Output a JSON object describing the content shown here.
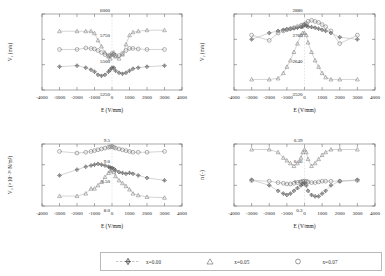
{
  "figure": {
    "series_colors": {
      "x000": "#4a4a4a",
      "x005": "#6e6e6e",
      "x007": "#8a8a8a"
    },
    "line_color": "#9a9a9a",
    "axis_color": "#555555"
  },
  "legend": {
    "items": [
      {
        "label": "x=0.00",
        "marker": "plus-diamond",
        "color": "#4a4a4a"
      },
      {
        "label": "x=0.05",
        "marker": "triangle",
        "color": "#7a7a7a"
      },
      {
        "label": "x=0.07",
        "marker": "circle",
        "color": "#6e6e6e"
      }
    ]
  },
  "chart_data": [
    {
      "type": "scatter",
      "panel": "top-left",
      "title": "",
      "xlabel": "E (V/mm)",
      "ylabel": "V₁ (m/s)",
      "xlim": [
        -4000,
        4000
      ],
      "ylim": [
        5250,
        6000
      ],
      "xticks": [
        -4000,
        -3000,
        -2000,
        -1000,
        0,
        1000,
        2000,
        3000,
        4000
      ],
      "xticklabels": [
        "-4000",
        "-3000",
        "-2000",
        "-1000",
        "0",
        "1000",
        "2000",
        "3000",
        "4000"
      ],
      "yticks": [
        5250,
        5500,
        5750,
        6000
      ],
      "yticklabels": [
        "5250",
        "5500",
        "5750",
        "6000"
      ],
      "grid": false,
      "series": [
        {
          "name": "x=0.00",
          "marker": "plus-diamond",
          "color": "#4a4a4a",
          "x": [
            -3000,
            -2000,
            -1500,
            -1200,
            -1000,
            -800,
            -600,
            -400,
            -200,
            -100,
            0,
            100,
            200,
            400,
            600,
            800,
            1000,
            1200,
            1500,
            2000,
            3000
          ],
          "y": [
            5480,
            5490,
            5470,
            5450,
            5430,
            5400,
            5390,
            5400,
            5430,
            5450,
            5470,
            5470,
            5440,
            5420,
            5410,
            5420,
            5440,
            5460,
            5470,
            5480,
            5490
          ]
        },
        {
          "name": "x=0.05",
          "marker": "triangle",
          "color": "#7a7a7a",
          "x": [
            -3000,
            -2000,
            -1500,
            -1200,
            -1000,
            -800,
            -600,
            -400,
            -200,
            -100,
            0,
            100,
            200,
            400,
            600,
            800,
            1000,
            1200,
            1500,
            2000,
            3000
          ],
          "y": [
            5830,
            5830,
            5830,
            5830,
            5810,
            5740,
            5680,
            5620,
            5580,
            5560,
            5600,
            5620,
            5580,
            5560,
            5600,
            5700,
            5790,
            5820,
            5830,
            5840,
            5840
          ]
        },
        {
          "name": "x=0.07",
          "marker": "circle",
          "color": "#6e6e6e",
          "x": [
            -3000,
            -2000,
            -1500,
            -1200,
            -1000,
            -800,
            -600,
            -400,
            -200,
            -100,
            0,
            100,
            200,
            400,
            600,
            800,
            1000,
            1200,
            1500,
            2000,
            3000
          ],
          "y": [
            5650,
            5650,
            5665,
            5660,
            5655,
            5640,
            5620,
            5600,
            5590,
            5590,
            5610,
            5600,
            5590,
            5590,
            5610,
            5640,
            5660,
            5660,
            5655,
            5650,
            5650
          ]
        }
      ]
    },
    {
      "type": "scatter",
      "panel": "top-right",
      "title": "",
      "xlabel": "E (V/mm)",
      "ylabel": "V₂ (m/s)",
      "xlim": [
        -4000,
        4000
      ],
      "ylim": [
        2520,
        2880
      ],
      "xticks": [
        -4000,
        -3000,
        -2000,
        -1000,
        0,
        1000,
        2000,
        3000,
        4000
      ],
      "xticklabels": [
        "-4000",
        "-3000",
        "-2000",
        "-1000",
        "0",
        "1000",
        "2000",
        "3000",
        "4000"
      ],
      "yticks": [
        2520,
        2640,
        2760,
        2880
      ],
      "yticklabels": [
        "2520",
        "2640",
        "2760",
        "2880"
      ],
      "grid": false,
      "series": [
        {
          "name": "x=0.00",
          "marker": "plus-diamond",
          "color": "#4a4a4a",
          "x": [
            -3000,
            -2000,
            -1500,
            -1200,
            -1000,
            -800,
            -600,
            -400,
            -200,
            -100,
            0,
            100,
            200,
            400,
            600,
            800,
            1000,
            1200,
            1500,
            2000,
            3000
          ],
          "y": [
            2760,
            2790,
            2800,
            2805,
            2808,
            2810,
            2812,
            2815,
            2818,
            2820,
            2830,
            2825,
            2820,
            2818,
            2815,
            2810,
            2805,
            2800,
            2790,
            2770,
            2760
          ]
        },
        {
          "name": "x=0.05",
          "marker": "triangle",
          "color": "#7a7a7a",
          "x": [
            -3000,
            -2000,
            -1500,
            -1200,
            -1000,
            -800,
            -600,
            -400,
            -200,
            -100,
            0,
            100,
            200,
            400,
            600,
            800,
            1000,
            1200,
            1500,
            2000,
            3000
          ],
          "y": [
            2570,
            2570,
            2575,
            2600,
            2630,
            2660,
            2700,
            2740,
            2780,
            2790,
            2790,
            2780,
            2745,
            2700,
            2660,
            2630,
            2600,
            2580,
            2570,
            2570,
            2570
          ]
        },
        {
          "name": "x=0.07",
          "marker": "circle",
          "color": "#6e6e6e",
          "x": [
            -3000,
            -2000,
            -1500,
            -1200,
            -1000,
            -800,
            -600,
            -400,
            -200,
            -100,
            0,
            100,
            200,
            400,
            600,
            800,
            1000,
            1200,
            1500,
            2000,
            3000
          ],
          "y": [
            2780,
            2755,
            2790,
            2800,
            2805,
            2810,
            2815,
            2820,
            2825,
            2828,
            2830,
            2835,
            2845,
            2850,
            2845,
            2840,
            2830,
            2820,
            2800,
            2740,
            2780
          ]
        }
      ]
    },
    {
      "type": "scatter",
      "panel": "bottom-left",
      "title": "",
      "xlabel": "E (V/mm)",
      "ylabel": "V₃ (×10⁻²⁰ N/m²)",
      "xlim": [
        -4000,
        4000
      ],
      "ylim": [
        8.0,
        9.5
      ],
      "xticks": [
        -4000,
        -3000,
        -2000,
        -1000,
        0,
        1000,
        2000,
        3000,
        4000
      ],
      "xticklabels": [
        "-4000",
        "-3000",
        "-2000",
        "-1000",
        "0",
        "1000",
        "2000",
        "3000",
        "4000"
      ],
      "yticks": [
        8.0,
        8.5,
        9.0,
        9.5
      ],
      "yticklabels": [
        "8.0",
        "8.50",
        "9.0",
        "9.5"
      ],
      "grid": false,
      "series": [
        {
          "name": "x=0.00",
          "marker": "plus-diamond",
          "color": "#4a4a4a",
          "x": [
            -3000,
            -2000,
            -1500,
            -1200,
            -1000,
            -800,
            -600,
            -400,
            -200,
            -100,
            0,
            100,
            200,
            400,
            600,
            800,
            1000,
            1200,
            1500,
            2000,
            3000
          ],
          "y": [
            8.74,
            8.88,
            8.95,
            8.98,
            9.0,
            9.02,
            9.0,
            8.98,
            8.95,
            8.93,
            8.92,
            8.9,
            8.86,
            8.82,
            8.8,
            8.78,
            8.8,
            8.78,
            8.74,
            8.68,
            8.62
          ]
        },
        {
          "name": "x=0.05",
          "marker": "triangle",
          "color": "#7a7a7a",
          "x": [
            -3000,
            -2000,
            -1500,
            -1200,
            -1000,
            -800,
            -600,
            -400,
            -200,
            -100,
            0,
            100,
            200,
            400,
            600,
            800,
            1000,
            1200,
            1500,
            2000,
            3000
          ],
          "y": [
            8.24,
            8.24,
            8.3,
            8.42,
            8.42,
            8.5,
            8.58,
            8.7,
            8.8,
            8.85,
            8.88,
            8.82,
            8.72,
            8.62,
            8.55,
            8.48,
            8.4,
            8.3,
            8.26,
            8.22,
            8.2
          ]
        },
        {
          "name": "x=0.07",
          "marker": "circle",
          "color": "#6e6e6e",
          "x": [
            -3000,
            -2000,
            -1500,
            -1200,
            -1000,
            -800,
            -600,
            -400,
            -200,
            -100,
            0,
            100,
            200,
            400,
            600,
            800,
            1000,
            1200,
            1500,
            2000,
            3000
          ],
          "y": [
            9.32,
            9.28,
            9.3,
            9.32,
            9.34,
            9.36,
            9.38,
            9.4,
            9.42,
            9.43,
            9.44,
            9.42,
            9.4,
            9.38,
            9.36,
            9.34,
            9.32,
            9.3,
            9.3,
            9.3,
            9.32
          ]
        }
      ]
    },
    {
      "type": "scatter",
      "panel": "bottom-right",
      "title": "",
      "xlabel": "E (V/mm)",
      "ylabel": "n (-)",
      "xlim": [
        -4000,
        4000
      ],
      "ylim": [
        0.3,
        0.39
      ],
      "xticks": [
        -4000,
        -3000,
        -2000,
        -1000,
        0,
        1000,
        2000,
        3000,
        4000
      ],
      "xticklabels": [
        "-4000",
        "-3000",
        "-2000",
        "-1000",
        "0",
        "1000",
        "2000",
        "3000",
        "4000"
      ],
      "yticks": [
        0.3,
        0.33,
        0.36,
        0.39
      ],
      "yticklabels": [
        "0.3",
        "0.33",
        "0.36",
        "0.39"
      ],
      "grid": false,
      "series": [
        {
          "name": "x=0.00",
          "marker": "plus-diamond",
          "color": "#4a4a4a",
          "x": [
            -3000,
            -2000,
            -1500,
            -1200,
            -1000,
            -800,
            -600,
            -400,
            -200,
            -100,
            0,
            100,
            200,
            400,
            600,
            800,
            1000,
            1200,
            1500,
            2000,
            3000
          ],
          "y": [
            0.338,
            0.33,
            0.322,
            0.318,
            0.316,
            0.318,
            0.322,
            0.326,
            0.33,
            0.332,
            0.334,
            0.33,
            0.322,
            0.316,
            0.314,
            0.314,
            0.318,
            0.322,
            0.33,
            0.336,
            0.338
          ]
        },
        {
          "name": "x=0.05",
          "marker": "triangle",
          "color": "#7a7a7a",
          "x": [
            -3000,
            -2000,
            -1500,
            -1200,
            -1000,
            -800,
            -600,
            -400,
            -200,
            -100,
            0,
            100,
            200,
            400,
            600,
            800,
            1000,
            1200,
            1500,
            2000,
            3000
          ],
          "y": [
            0.382,
            0.382,
            0.378,
            0.37,
            0.366,
            0.362,
            0.358,
            0.362,
            0.37,
            0.378,
            0.382,
            0.378,
            0.368,
            0.358,
            0.362,
            0.368,
            0.374,
            0.378,
            0.382,
            0.382,
            0.382
          ]
        },
        {
          "name": "x=0.07",
          "marker": "circle",
          "color": "#6e6e6e",
          "x": [
            -3000,
            -2000,
            -1500,
            -1200,
            -1000,
            -800,
            -600,
            -400,
            -200,
            -100,
            0,
            100,
            200,
            400,
            600,
            800,
            1000,
            1200,
            1500,
            2000,
            3000
          ],
          "y": [
            0.337,
            0.336,
            0.334,
            0.333,
            0.332,
            0.332,
            0.333,
            0.334,
            0.335,
            0.336,
            0.336,
            0.336,
            0.335,
            0.334,
            0.334,
            0.335,
            0.336,
            0.336,
            0.336,
            0.336,
            0.337
          ]
        }
      ]
    }
  ]
}
